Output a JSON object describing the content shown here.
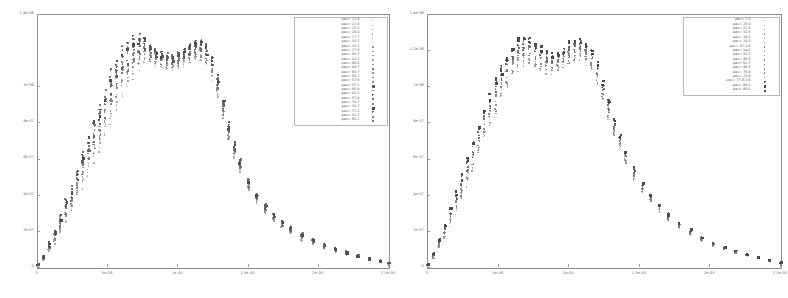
{
  "figure": {
    "background": "#ffffff",
    "frame_color": "#8d8d8d",
    "text_color": "#5d5d5d",
    "panel_count": 2
  },
  "chart_data": [
    {
      "type": "scatter",
      "panel": "left",
      "title": "",
      "xlabel": "",
      "ylabel": "",
      "xlim": [
        0,
        2.5e-05
      ],
      "ylim": [
        0,
        1.4e-06
      ],
      "grid": false,
      "legend_position": "top-right",
      "xticks": [
        0,
        5e-06,
        1e-05,
        1.5e-05,
        2e-05,
        2.5e-05
      ],
      "xtick_labels": [
        "0",
        "5e-06",
        "1e-05",
        "1.5e-05",
        "2e-05",
        "2.5e-05"
      ],
      "yticks": [
        0,
        2e-07,
        4e-07,
        6e-07,
        8e-07,
        1e-06,
        1.4e-06
      ],
      "ytick_labels": [
        "0",
        "2e-07",
        "4e-07",
        "6e-07",
        "8e-07",
        "1e-06",
        "1.4e-06"
      ],
      "series": [
        {
          "name": "pav= 11.4",
          "marker": "dot",
          "shade": "#9c9c9c",
          "size": 1.0
        },
        {
          "name": "pav= 22.4",
          "marker": "dot",
          "shade": "#a2a2a2",
          "size": 1.0
        },
        {
          "name": "pav= 23.2",
          "marker": "dot",
          "shade": "#979797",
          "size": 1.0
        },
        {
          "name": "pav= 25.4",
          "marker": "dot",
          "shade": "#9e9e9e",
          "size": 1.0
        },
        {
          "name": "pav= 27.7",
          "marker": "dot",
          "shade": "#8f8f8f",
          "size": 1.0
        },
        {
          "name": "pav= 30.7",
          "marker": "dot",
          "shade": "#949494",
          "size": 1.0
        },
        {
          "name": "pav= 33.7",
          "marker": "dot",
          "shade": "#8a8a8a",
          "size": 1.1
        },
        {
          "name": "pav= 37.5",
          "marker": "plus",
          "shade": "#8c8c8c",
          "size": 1.1
        },
        {
          "name": "pav= 40.7",
          "marker": "dot",
          "shade": "#868686",
          "size": 1.1
        },
        {
          "name": "pav= 43.2",
          "marker": "plus",
          "shade": "#8b8b8b",
          "size": 1.1
        },
        {
          "name": "pav= 45.4",
          "marker": "dot",
          "shade": "#818181",
          "size": 1.1
        },
        {
          "name": "pav= 48.7",
          "marker": "square",
          "shade": "#767676",
          "size": 1.3
        },
        {
          "name": "pav= 50.7",
          "marker": "dot",
          "shade": "#7d7d7d",
          "size": 1.2
        },
        {
          "name": "pav= 54.7",
          "marker": "dot",
          "shade": "#737373",
          "size": 1.2
        },
        {
          "name": "pav= 57.5",
          "marker": "dot",
          "shade": "#787878",
          "size": 1.2
        },
        {
          "name": "pav= 57.2",
          "marker": "square",
          "shade": "#5a5a5a",
          "size": 1.6
        },
        {
          "name": "pav= 60.8",
          "marker": "dot",
          "shade": "#6d6d6d",
          "size": 1.3
        },
        {
          "name": "pav= 63.2",
          "marker": "plus",
          "shade": "#6a6a6a",
          "size": 1.3
        },
        {
          "name": "pav= 67.4",
          "marker": "dot",
          "shade": "#636363",
          "size": 1.3
        },
        {
          "name": "pav= 70.7",
          "marker": "dot",
          "shade": "#5e5e5e",
          "size": 1.4
        },
        {
          "name": "pav= 74.7",
          "marker": "square",
          "shade": "#4a4a4a",
          "size": 1.7
        },
        {
          "name": "pav= 77.2",
          "marker": "plus",
          "shade": "#5b5b5b",
          "size": 1.4
        },
        {
          "name": "pav= 82.2",
          "marker": "dot",
          "shade": "#555555",
          "size": 1.4
        },
        {
          "name": "pav= 90.2",
          "marker": "dot",
          "shade": "#4f4f4f",
          "size": 1.5
        }
      ],
      "profile_note": "double-humped (M-shaped) rise to ~1.25e-06 near x=8e-06, dip near 1.05e-05, second hump near 1.25e-05, long decaying tail to 2.5e-05",
      "envelope": {
        "x": [
          0.0,
          0.4,
          0.8,
          1.2,
          1.6,
          2.0,
          2.4,
          2.8,
          3.2,
          3.6,
          4.0,
          4.4,
          4.8,
          5.2,
          5.6,
          6.0,
          6.4,
          6.8,
          7.2,
          7.6,
          8.0,
          8.4,
          8.8,
          9.2,
          9.6,
          10.0,
          10.4,
          10.8,
          11.2,
          11.6,
          12.0,
          12.4,
          12.8,
          13.2,
          13.6,
          14.0,
          14.4,
          15.0,
          15.6,
          16.2,
          16.8,
          17.4,
          18.0,
          18.8,
          19.6,
          20.4,
          21.2,
          22.0,
          22.8,
          23.6,
          24.4,
          25.0
        ],
        "x_scale": 1e-06,
        "upper": [
          0.02,
          0.07,
          0.14,
          0.21,
          0.29,
          0.37,
          0.45,
          0.54,
          0.63,
          0.72,
          0.81,
          0.9,
          0.99,
          1.07,
          1.14,
          1.2,
          1.24,
          1.27,
          1.28,
          1.27,
          1.24,
          1.21,
          1.19,
          1.18,
          1.18,
          1.19,
          1.21,
          1.23,
          1.25,
          1.25,
          1.23,
          1.17,
          1.06,
          0.93,
          0.8,
          0.69,
          0.6,
          0.49,
          0.41,
          0.35,
          0.3,
          0.26,
          0.23,
          0.19,
          0.16,
          0.13,
          0.11,
          0.09,
          0.07,
          0.055,
          0.04,
          0.03
        ],
        "lower": [
          0.01,
          0.04,
          0.09,
          0.14,
          0.2,
          0.26,
          0.32,
          0.39,
          0.46,
          0.53,
          0.6,
          0.67,
          0.74,
          0.82,
          0.89,
          0.96,
          1.02,
          1.07,
          1.11,
          1.13,
          1.13,
          1.12,
          1.11,
          1.1,
          1.1,
          1.11,
          1.12,
          1.14,
          1.15,
          1.15,
          1.12,
          1.05,
          0.95,
          0.83,
          0.71,
          0.61,
          0.53,
          0.43,
          0.36,
          0.3,
          0.26,
          0.22,
          0.19,
          0.15,
          0.13,
          0.105,
          0.085,
          0.07,
          0.055,
          0.04,
          0.03,
          0.02
        ],
        "y_scale": 1e-06
      }
    },
    {
      "type": "scatter",
      "panel": "right",
      "title": "",
      "xlabel": "",
      "ylabel": "",
      "xlim": [
        0,
        2.5e-05
      ],
      "ylim": [
        0,
        1.4e-06
      ],
      "grid": false,
      "legend_position": "top-right",
      "xticks": [
        0,
        5e-06,
        1e-05,
        1.5e-05,
        2e-05,
        2.5e-05
      ],
      "xtick_labels": [
        "0",
        "5e-06",
        "1e-05",
        "1.5e-05",
        "2e-05",
        "2.5e-05"
      ],
      "yticks": [
        0,
        2e-07,
        4e-07,
        6e-07,
        8e-07,
        1e-06,
        1.2e-06,
        1.4e-06
      ],
      "ytick_labels": [
        "0",
        "2e-07",
        "4e-07",
        "6e-07",
        "8e-07",
        "1e-06",
        "1.2e-06",
        "1.4e-06"
      ],
      "series": [
        {
          "name": "pav=  1.0",
          "marker": "dot",
          "shade": "#9a9a9a",
          "size": 1.0
        },
        {
          "name": "pav= 20.0",
          "marker": "dot",
          "shade": "#949494",
          "size": 1.0
        },
        {
          "name": "pav= 21.5",
          "marker": "plus",
          "shade": "#909090",
          "size": 1.0
        },
        {
          "name": "pav= 31.5",
          "marker": "dot",
          "shade": "#8c8c8c",
          "size": 1.0
        },
        {
          "name": "pav= 36.0",
          "marker": "dot",
          "shade": "#888888",
          "size": 1.1
        },
        {
          "name": "pav= 33.0",
          "marker": "dot",
          "shade": "#848484",
          "size": 1.1
        },
        {
          "name": "pav= 57.1.0",
          "marker": "plus",
          "shade": "#7f7f7f",
          "size": 1.1
        },
        {
          "name": "pav= 1a.0",
          "marker": "dot",
          "shade": "#7b7b7b",
          "size": 1.1
        },
        {
          "name": "pav= 52.0",
          "marker": "dot",
          "shade": "#777777",
          "size": 1.2
        },
        {
          "name": "pav= 46.0",
          "marker": "dot",
          "shade": "#727272",
          "size": 1.2
        },
        {
          "name": "pav= 62.7",
          "marker": "plus",
          "shade": "#6d6d6d",
          "size": 1.2
        },
        {
          "name": "pav= 46.5",
          "marker": "dot",
          "shade": "#686868",
          "size": 1.3
        },
        {
          "name": "pav= 70.6",
          "marker": "dot",
          "shade": "#636363",
          "size": 1.3
        },
        {
          "name": "pav= 74.6",
          "marker": "dot",
          "shade": "#5d5d5d",
          "size": 1.3
        },
        {
          "name": "pav= 77.9.1.6",
          "marker": "plus",
          "shade": "#585858",
          "size": 1.4
        },
        {
          "name": "pav= 86.0",
          "marker": "square",
          "shade": "#464646",
          "size": 1.7
        },
        {
          "name": "pav= 90.0",
          "marker": "square",
          "shade": "#4b4b4b",
          "size": 1.6
        }
      ],
      "profile_note": "single broad M-shaped plateau peaking ~1.25e-06 between x=7e-06 and 1.2e-05 with a shallow central dip, steep fall after 1.3e-05, tail to 2.5e-05",
      "envelope": {
        "x": [
          0.0,
          0.4,
          0.8,
          1.2,
          1.6,
          2.0,
          2.4,
          2.8,
          3.2,
          3.6,
          4.0,
          4.4,
          4.8,
          5.2,
          5.6,
          6.0,
          6.4,
          6.8,
          7.2,
          7.6,
          8.0,
          8.4,
          8.8,
          9.2,
          9.6,
          10.0,
          10.4,
          10.8,
          11.2,
          11.6,
          12.0,
          12.4,
          12.8,
          13.2,
          13.6,
          14.0,
          14.6,
          15.2,
          15.8,
          16.4,
          17.0,
          17.8,
          18.6,
          19.4,
          20.2,
          21.0,
          21.8,
          22.6,
          23.4,
          24.2,
          25.0
        ],
        "x_scale": 1e-06,
        "upper": [
          0.02,
          0.08,
          0.16,
          0.24,
          0.33,
          0.42,
          0.51,
          0.6,
          0.69,
          0.78,
          0.87,
          0.96,
          1.04,
          1.11,
          1.17,
          1.22,
          1.26,
          1.28,
          1.27,
          1.24,
          1.21,
          1.19,
          1.18,
          1.19,
          1.21,
          1.24,
          1.26,
          1.26,
          1.24,
          1.2,
          1.13,
          1.03,
          0.92,
          0.82,
          0.73,
          0.65,
          0.55,
          0.47,
          0.41,
          0.35,
          0.3,
          0.25,
          0.21,
          0.17,
          0.14,
          0.115,
          0.095,
          0.075,
          0.06,
          0.045,
          0.03
        ],
        "lower": [
          0.01,
          0.05,
          0.11,
          0.17,
          0.24,
          0.31,
          0.38,
          0.46,
          0.54,
          0.62,
          0.7,
          0.78,
          0.86,
          0.93,
          1.0,
          1.06,
          1.1,
          1.13,
          1.13,
          1.11,
          1.09,
          1.08,
          1.08,
          1.09,
          1.11,
          1.13,
          1.15,
          1.15,
          1.13,
          1.09,
          1.02,
          0.93,
          0.83,
          0.74,
          0.66,
          0.58,
          0.49,
          0.42,
          0.36,
          0.31,
          0.26,
          0.22,
          0.18,
          0.15,
          0.12,
          0.1,
          0.08,
          0.065,
          0.05,
          0.035,
          0.02
        ],
        "y_scale": 1e-06
      }
    }
  ]
}
